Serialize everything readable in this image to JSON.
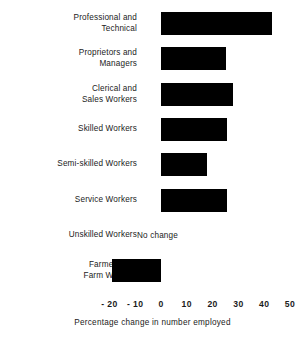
{
  "chart_data": {
    "type": "bar",
    "orientation": "horizontal",
    "title": "",
    "xlabel": "Percentage change in number employed",
    "ylabel": "",
    "xlim": [
      -20,
      50
    ],
    "xticks": [
      -20,
      -10,
      0,
      10,
      20,
      30,
      40,
      50
    ],
    "xtick_labels": [
      "- 20",
      "- 10",
      "0",
      "10",
      "20",
      "30",
      "40",
      "50"
    ],
    "grid": false,
    "legend": null,
    "bar_color": "#000000",
    "background_color": "#ffffff",
    "categories": [
      "Professional and\nTechnical",
      "Proprietors and\nManagers",
      "Clerical and\nSales Workers",
      "Skilled Workers",
      "Semi-skilled Workers",
      "Service Workers",
      "Unskilled Workers",
      "Farmers and\nFarm Workers"
    ],
    "values": [
      43,
      25,
      28,
      25.5,
      18,
      25.5,
      0,
      -19
    ],
    "annotations": [
      {
        "category": "Unskilled Workers",
        "text": "No change",
        "value": 0
      }
    ]
  },
  "axis": {
    "title": "Percentage change in number employed",
    "ticks": [
      {
        "label": "- 20",
        "value": -20
      },
      {
        "label": "- 10",
        "value": -10
      },
      {
        "label": "0",
        "value": 0
      },
      {
        "label": "10",
        "value": 10
      },
      {
        "label": "20",
        "value": 20
      },
      {
        "label": "30",
        "value": 30
      },
      {
        "label": "40",
        "value": 40
      },
      {
        "label": "50",
        "value": 50
      }
    ]
  },
  "rows": [
    {
      "label": "Professional and\nTechnical",
      "value": 43,
      "annotation": null
    },
    {
      "label": "Proprietors and\nManagers",
      "value": 25,
      "annotation": null
    },
    {
      "label": "Clerical and\nSales Workers",
      "value": 28,
      "annotation": null
    },
    {
      "label": "Skilled Workers",
      "value": 25.5,
      "annotation": null
    },
    {
      "label": "Semi-skilled Workers",
      "value": 18,
      "annotation": null
    },
    {
      "label": "Service Workers",
      "value": 25.5,
      "annotation": null
    },
    {
      "label": "Unskilled Workers",
      "value": 0,
      "annotation": "No change"
    },
    {
      "label": "Farmers and\nFarm Workers",
      "value": -19,
      "annotation": null
    }
  ]
}
